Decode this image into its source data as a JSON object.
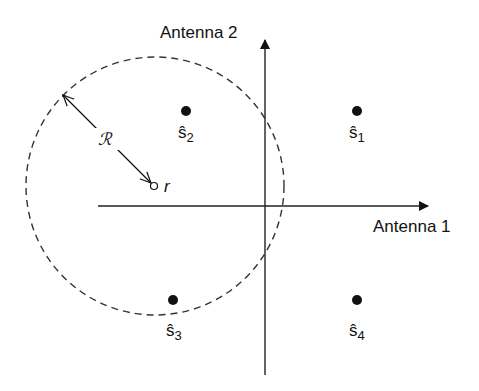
{
  "diagram": {
    "axes": {
      "x_label": "Antenna 1",
      "y_label": "Antenna 2"
    },
    "radius_label": "ℛ",
    "received_point_label": "r",
    "symbols": [
      {
        "hat": "ŝ",
        "sub": "1"
      },
      {
        "hat": "ŝ",
        "sub": "2"
      },
      {
        "hat": "ŝ",
        "sub": "3"
      },
      {
        "hat": "ŝ",
        "sub": "4"
      }
    ],
    "colors": {
      "ink": "#111111",
      "axis": "#222222",
      "dash": "#333333"
    }
  }
}
